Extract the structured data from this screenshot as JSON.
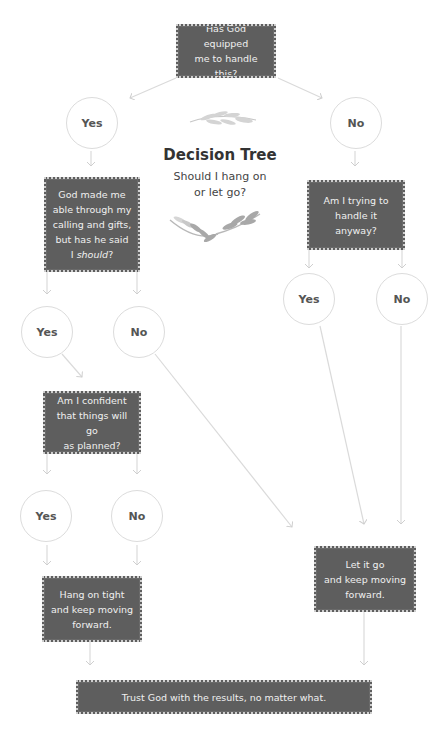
{
  "title": "Decision Tree",
  "subtitle_line1": "Should I hang on",
  "subtitle_line2": "or let go?",
  "nodes": {
    "root": {
      "line1": "Has God equipped",
      "line2": "me to handle this?"
    },
    "yes1": "Yes",
    "no1": "No",
    "q_left": {
      "line1": "God made me",
      "line2": "able through my",
      "line3": "calling and gifts,",
      "line4": "but has he said",
      "line5_prefix": "I ",
      "line5_em": "should",
      "line5_suffix": "?"
    },
    "q_right": {
      "line1": "Am I trying to",
      "line2": "handle it anyway?"
    },
    "yes2_left": "Yes",
    "no2_left": "No",
    "yes2_right": "Yes",
    "no2_right": "No",
    "q_confident": {
      "line1": "Am I confident",
      "line2": "that things will go",
      "line3": "as planned?"
    },
    "yes3": "Yes",
    "no3": "No",
    "hang_on": {
      "line1": "Hang on tight",
      "line2": "and keep moving",
      "line3": "forward."
    },
    "let_go": {
      "line1": "Let it go",
      "line2": "and keep moving",
      "line3": "forward."
    },
    "final": "Trust God with the results, no matter what."
  },
  "colors": {
    "box": "#5e5e5e",
    "line": "#d8d8d8",
    "circle_border": "#dcdcdc",
    "text_dark": "#333333"
  }
}
